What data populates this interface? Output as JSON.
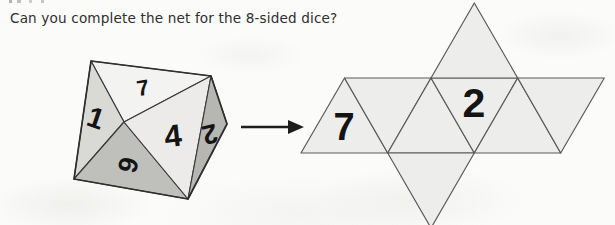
{
  "question": {
    "text": "Can you complete the net for the 8-sided dice?"
  },
  "die": {
    "name": "8-sided dice (octahedron)",
    "outline_color": "#3a3a3a",
    "faces": [
      {
        "face": "top",
        "label": "7",
        "fill": "#f3f3f1"
      },
      {
        "face": "upper-left",
        "label": "1",
        "fill": "#d9d9d6"
      },
      {
        "face": "lower-left",
        "label": "6",
        "fill": "#bfbfbc"
      },
      {
        "face": "front",
        "label": "4",
        "fill": "#ecebe9"
      },
      {
        "face": "right",
        "label": "2",
        "fill": "#b6b6b3"
      }
    ]
  },
  "arrow": {
    "name": "maps-to-arrow",
    "direction": "right",
    "color": "#1d1d1d"
  },
  "net": {
    "name": "octahedron net",
    "fill": "#ededeb",
    "stroke": "#5b5b5b",
    "triangle_count": 8,
    "triangles": [
      {
        "id": "strip-1",
        "orientation": "up",
        "label": "7"
      },
      {
        "id": "strip-2",
        "orientation": "down",
        "label": ""
      },
      {
        "id": "strip-3",
        "orientation": "up",
        "label": ""
      },
      {
        "id": "strip-4",
        "orientation": "down",
        "label": "2"
      },
      {
        "id": "strip-5",
        "orientation": "up",
        "label": ""
      },
      {
        "id": "strip-6",
        "orientation": "down",
        "label": ""
      },
      {
        "id": "flap-top",
        "orientation": "up",
        "label": ""
      },
      {
        "id": "flap-bottom",
        "orientation": "down",
        "label": ""
      }
    ]
  }
}
